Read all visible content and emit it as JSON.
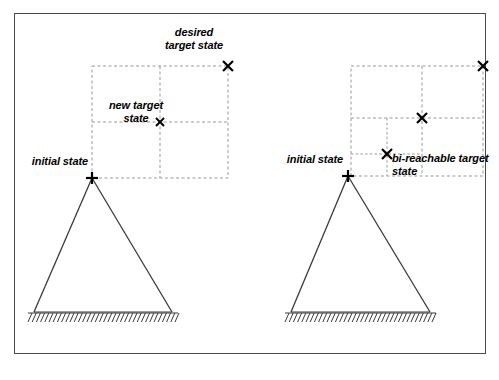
{
  "figure": {
    "background_color": "#ffffff",
    "border_color": "#4a4a4a",
    "line_color": "#333333",
    "grid_color": "#999999",
    "marker_color": "#000000"
  },
  "panels": [
    {
      "id": "left-panel",
      "name": "desired-target-state-panel",
      "labels": {
        "desired_target_state": "desired\ntarget state",
        "new_target_state": "new target\nstate",
        "initial_state": "initial state"
      },
      "markers": [
        {
          "name": "desired-target-state-marker",
          "glyph": "x",
          "x": 228,
          "y": 66
        },
        {
          "name": "new-target-state-marker",
          "glyph": "x",
          "x": 160,
          "y": 122
        },
        {
          "name": "initial-state-marker",
          "glyph": "plus",
          "x": 92,
          "y": 178
        }
      ],
      "grid": {
        "x0": 92,
        "y0": 66,
        "x1": 228,
        "y1": 178,
        "cols": 2,
        "rows": 2
      },
      "truss": {
        "apex_x": 92,
        "apex_y": 178,
        "base_left_x": 34,
        "base_right_x": 172,
        "base_y": 312
      },
      "ground": {
        "x0": 28,
        "x1": 178,
        "y": 313
      }
    },
    {
      "id": "right-panel",
      "name": "bi-reachable-target-state-panel",
      "labels": {
        "initial_state": "initial state",
        "bi_reachable_target_state": "bi-reachable target\nstate"
      },
      "markers": [
        {
          "name": "desired-target-state-marker",
          "glyph": "x",
          "x": 483,
          "y": 66
        },
        {
          "name": "intermediate-target-state-marker",
          "glyph": "x",
          "x": 422,
          "y": 118
        },
        {
          "name": "bi-reachable-target-state-marker",
          "glyph": "x",
          "x": 387,
          "y": 154
        },
        {
          "name": "initial-state-marker",
          "glyph": "plus",
          "x": 348,
          "y": 176
        }
      ],
      "outer_grid": {
        "x0": 351,
        "y0": 66,
        "x1": 483,
        "y1": 176,
        "cols": 2,
        "rows": 2,
        "col_split": 422,
        "row_split": 118
      },
      "inner_grid": {
        "x0": 351,
        "y0": 118,
        "x1": 422,
        "y1": 176,
        "cols": 2,
        "rows": 2,
        "col_split": 387,
        "row_split": 154
      },
      "truss": {
        "apex_x": 348,
        "apex_y": 176,
        "base_left_x": 291,
        "base_right_x": 430,
        "base_y": 312
      },
      "ground": {
        "x0": 285,
        "x1": 436,
        "y": 313
      }
    }
  ]
}
